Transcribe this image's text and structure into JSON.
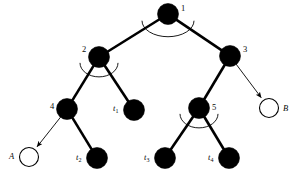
{
  "figure": {
    "type": "tree-diagram",
    "background_color": "#ffffff",
    "ink_color": "#000000",
    "width": 294,
    "height": 179
  },
  "nodes": [
    {
      "id": "n1",
      "label": "1",
      "label_style": "plain",
      "fill": "solid",
      "cx": 168,
      "cy": 14,
      "r": 10.5,
      "label_x": 181,
      "label_y": 4,
      "has_angle_arc": true
    },
    {
      "id": "n2",
      "label": "2",
      "label_style": "plain",
      "fill": "solid",
      "cx": 99,
      "cy": 57,
      "r": 10.5,
      "label_x": 82,
      "label_y": 45,
      "has_angle_arc": true
    },
    {
      "id": "n3",
      "label": "3",
      "label_style": "plain",
      "fill": "solid",
      "cx": 230,
      "cy": 56,
      "r": 10.5,
      "label_x": 243,
      "label_y": 45,
      "has_angle_arc": false
    },
    {
      "id": "n4",
      "label": "4",
      "label_style": "plain",
      "fill": "solid",
      "cx": 67,
      "cy": 109,
      "r": 10.5,
      "label_x": 50,
      "label_y": 102,
      "has_angle_arc": false
    },
    {
      "id": "n5",
      "label": "5",
      "label_style": "plain",
      "fill": "solid",
      "cx": 199,
      "cy": 108,
      "r": 10.5,
      "label_x": 212,
      "label_y": 103,
      "has_angle_arc": true
    },
    {
      "id": "nA",
      "label": "A",
      "label_style": "italic",
      "fill": "open",
      "cx": 29,
      "cy": 157,
      "r": 9.5,
      "label_x": 9,
      "label_y": 152,
      "has_angle_arc": false
    },
    {
      "id": "nB",
      "label": "B",
      "label_style": "italic",
      "fill": "open",
      "cx": 269,
      "cy": 108,
      "r": 9.5,
      "label_x": 283,
      "label_y": 104,
      "has_angle_arc": false
    },
    {
      "id": "t1",
      "label": "t",
      "label_style": "italic-sub",
      "sub": "1",
      "fill": "solid",
      "cx": 134,
      "cy": 110,
      "r": 10.5,
      "label_x": 113,
      "label_y": 104,
      "has_angle_arc": false
    },
    {
      "id": "t2",
      "label": "t",
      "label_style": "italic-sub",
      "sub": "2",
      "fill": "solid",
      "cx": 97,
      "cy": 158,
      "r": 10.5,
      "label_x": 76,
      "label_y": 153,
      "has_angle_arc": false
    },
    {
      "id": "t3",
      "label": "t",
      "label_style": "italic-sub",
      "sub": "3",
      "fill": "solid",
      "cx": 165,
      "cy": 158,
      "r": 10.5,
      "label_x": 144,
      "label_y": 153,
      "has_angle_arc": false
    },
    {
      "id": "t4",
      "label": "t",
      "label_style": "italic-sub",
      "sub": "4",
      "fill": "solid",
      "cx": 229,
      "cy": 158,
      "r": 10.5,
      "label_x": 208,
      "label_y": 153,
      "has_angle_arc": false
    }
  ],
  "edges": [
    {
      "id": "e1-2",
      "from": "n1",
      "to": "n2",
      "style": "thick",
      "arrow": false
    },
    {
      "id": "e1-3",
      "from": "n1",
      "to": "n3",
      "style": "thick",
      "arrow": false
    },
    {
      "id": "e2-4",
      "from": "n2",
      "to": "n4",
      "style": "thick",
      "arrow": false
    },
    {
      "id": "e2-t1",
      "from": "n2",
      "to": "t1",
      "style": "thick",
      "arrow": false
    },
    {
      "id": "e3-5",
      "from": "n3",
      "to": "n5",
      "style": "thick",
      "arrow": false
    },
    {
      "id": "e3-B",
      "from": "n3",
      "to": "nB",
      "style": "thin",
      "arrow": true
    },
    {
      "id": "e4-A",
      "from": "n4",
      "to": "nA",
      "style": "thin",
      "arrow": true
    },
    {
      "id": "e4-t2",
      "from": "n4",
      "to": "t2",
      "style": "thick",
      "arrow": false
    },
    {
      "id": "e5-t3",
      "from": "n5",
      "to": "t3",
      "style": "thick",
      "arrow": false
    },
    {
      "id": "e5-t4",
      "from": "n5",
      "to": "t4",
      "style": "thick",
      "arrow": false
    }
  ],
  "angle_arcs": [
    {
      "id": "arc-n1",
      "at": "n1",
      "rx": 26,
      "ry": 16,
      "cx": 168,
      "cy": 14
    },
    {
      "id": "arc-n2",
      "at": "n2",
      "rx": 19,
      "ry": 14,
      "cx": 99,
      "cy": 57
    },
    {
      "id": "arc-n5",
      "at": "n5",
      "rx": 19,
      "ry": 14,
      "cx": 199,
      "cy": 108
    }
  ]
}
